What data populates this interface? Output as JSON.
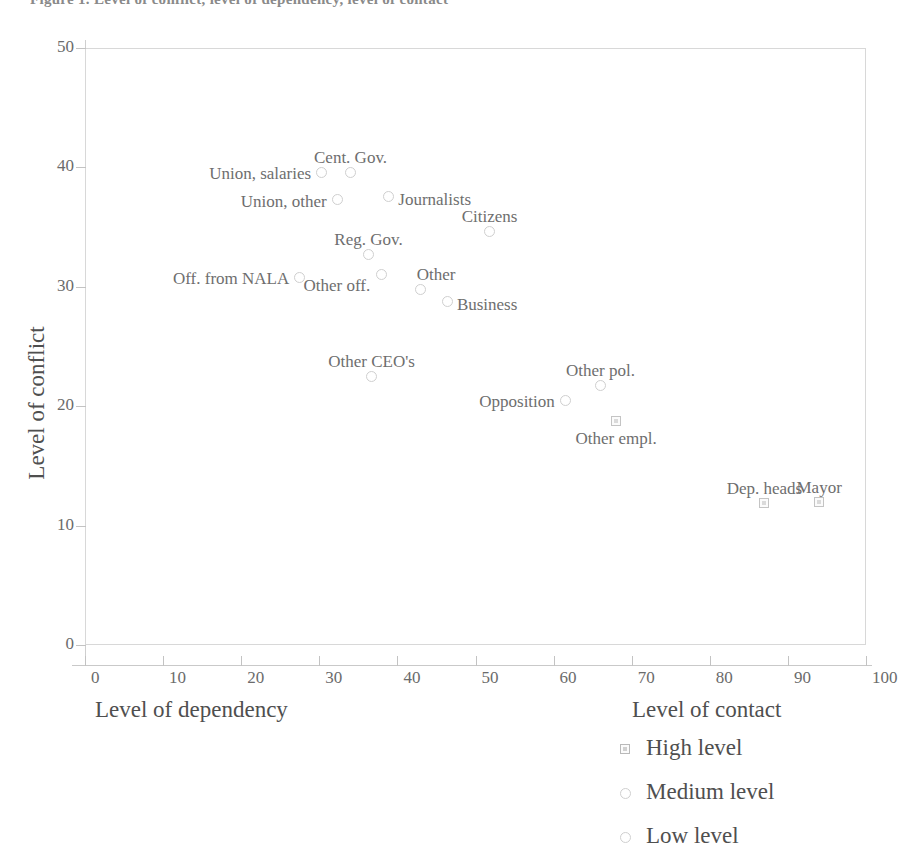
{
  "chart_data": {
    "type": "scatter",
    "title": "Figure 1. Level of conflict, level of dependency, level of contact",
    "xlabel_left": "Level of dependency",
    "xlabel_right": "Level of contact",
    "ylabel": "Level of conflict",
    "xlim": [
      0,
      100
    ],
    "ylim": [
      0,
      50
    ],
    "xticks": [
      0,
      10,
      20,
      30,
      40,
      50,
      60,
      70,
      80,
      90,
      100
    ],
    "yticks": [
      0,
      10,
      20,
      30,
      40,
      50
    ],
    "grid": false,
    "legend_title": "Level of contact",
    "legend_position": "bottom-right",
    "legend": [
      {
        "label": "High level",
        "marker": "square"
      },
      {
        "label": "Medium level",
        "marker": "circle"
      },
      {
        "label": "Low level",
        "marker": "circle"
      }
    ],
    "points": [
      {
        "label": "Cent. Gov.",
        "x": 34.0,
        "y": 39.6,
        "marker": "circle",
        "label_pos": "above"
      },
      {
        "label": "Union, salaries",
        "x": 30.3,
        "y": 39.6,
        "marker": "circle",
        "label_pos": "left"
      },
      {
        "label": "Union, other",
        "x": 32.3,
        "y": 37.3,
        "marker": "circle",
        "label_pos": "left"
      },
      {
        "label": "Journalists",
        "x": 38.9,
        "y": 37.6,
        "marker": "circle",
        "label_pos": "right"
      },
      {
        "label": "Citizens",
        "x": 51.8,
        "y": 34.6,
        "marker": "circle",
        "label_pos": "above"
      },
      {
        "label": "Reg. Gov.",
        "x": 36.3,
        "y": 32.7,
        "marker": "circle",
        "label_pos": "above"
      },
      {
        "label": "Off. from NALA",
        "x": 27.5,
        "y": 30.8,
        "marker": "circle",
        "label_pos": "left"
      },
      {
        "label": "Other off.",
        "x": 38.0,
        "y": 31.0,
        "marker": "circle",
        "label_pos": "belowleft"
      },
      {
        "label": "Other",
        "x": 43.0,
        "y": 29.8,
        "marker": "circle",
        "label_pos": "aboveright"
      },
      {
        "label": "Business",
        "x": 46.4,
        "y": 28.8,
        "marker": "circle",
        "label_pos": "right"
      },
      {
        "label": "Other CEO's",
        "x": 36.7,
        "y": 22.5,
        "marker": "circle",
        "label_pos": "above"
      },
      {
        "label": "Other pol.",
        "x": 66.0,
        "y": 21.7,
        "marker": "circle",
        "label_pos": "above"
      },
      {
        "label": "Opposition",
        "x": 61.5,
        "y": 20.5,
        "marker": "circle",
        "label_pos": "left"
      },
      {
        "label": "Other empl.",
        "x": 68.0,
        "y": 18.8,
        "marker": "square",
        "label_pos": "below"
      },
      {
        "label": "Dep. heads",
        "x": 87.0,
        "y": 11.9,
        "marker": "square",
        "label_pos": "above"
      },
      {
        "label": "Mayor",
        "x": 94.0,
        "y": 12.0,
        "marker": "square",
        "label_pos": "above"
      }
    ]
  }
}
